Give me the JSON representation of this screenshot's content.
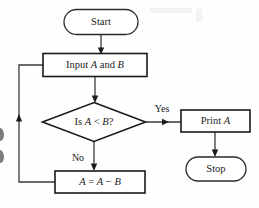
{
  "diagram": {
    "type": "flowchart",
    "background_color": "#fefefe",
    "line_color": "#3a3a3a",
    "shape_border_color": "#1a1a1a",
    "text_color": "#1c1c1c",
    "nodes": [
      {
        "id": "start",
        "shape": "terminator",
        "label": "Start",
        "label_parts": [
          {
            "text": "Start",
            "italic": false
          }
        ],
        "cx": 101,
        "cy": 22,
        "width": 74,
        "height": 25
      },
      {
        "id": "input",
        "shape": "process",
        "label": "Input A and B",
        "label_parts": [
          {
            "text": "Input ",
            "italic": false
          },
          {
            "text": "A",
            "italic": true
          },
          {
            "text": " and ",
            "italic": false
          },
          {
            "text": "B",
            "italic": true
          }
        ],
        "cx": 95,
        "cy": 65,
        "width": 104,
        "height": 23
      },
      {
        "id": "decision",
        "shape": "decision",
        "label": "Is A < B?",
        "label_parts": [
          {
            "text": "Is ",
            "italic": false
          },
          {
            "text": "A",
            "italic": true
          },
          {
            "text": " < ",
            "italic": false
          },
          {
            "text": "B",
            "italic": true
          },
          {
            "text": "?",
            "italic": false
          }
        ],
        "cx": 94,
        "cy": 122,
        "width": 103,
        "height": 39
      },
      {
        "id": "print",
        "shape": "process",
        "label": "Print A",
        "label_parts": [
          {
            "text": "Print ",
            "italic": false
          },
          {
            "text": "A",
            "italic": true
          }
        ],
        "cx": 215,
        "cy": 121,
        "width": 69,
        "height": 22
      },
      {
        "id": "stop",
        "shape": "terminator",
        "label": "Stop",
        "label_parts": [
          {
            "text": "Stop",
            "italic": false
          }
        ],
        "cx": 216,
        "cy": 169,
        "width": 60,
        "height": 24
      },
      {
        "id": "assign",
        "shape": "process",
        "label": "A = A - B",
        "label_parts": [
          {
            "text": "A",
            "italic": true
          },
          {
            "text": " = ",
            "italic": false
          },
          {
            "text": "A",
            "italic": true
          },
          {
            "text": " − ",
            "italic": false
          },
          {
            "text": "B",
            "italic": true
          }
        ],
        "cx": 100,
        "cy": 182,
        "width": 90,
        "height": 22
      }
    ],
    "edges": [
      {
        "id": "start-to-input",
        "from": "start",
        "to": "input",
        "label": ""
      },
      {
        "id": "input-to-decision",
        "from": "input",
        "to": "decision",
        "label": ""
      },
      {
        "id": "decision-to-print",
        "from": "decision",
        "to": "print",
        "label": "Yes"
      },
      {
        "id": "decision-to-assign",
        "from": "decision",
        "to": "assign",
        "label": "No"
      },
      {
        "id": "print-to-stop",
        "from": "print",
        "to": "stop",
        "label": ""
      },
      {
        "id": "assign-to-input",
        "from": "assign",
        "to": "input",
        "label": ""
      }
    ],
    "edge_labels": {
      "yes": "Yes",
      "no": "No"
    }
  }
}
